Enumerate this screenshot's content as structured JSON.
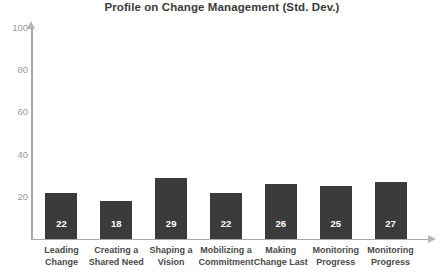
{
  "chart_data": {
    "type": "bar",
    "title": "Profile on Change Management (Std. Dev.)",
    "xlabel": "",
    "ylabel": "",
    "ylim": [
      0,
      100
    ],
    "yticks": [
      100,
      80,
      60,
      40,
      20
    ],
    "grid": false,
    "legend": null,
    "bar_color": "#3b3b3b",
    "axis_color": "#a8a8a8",
    "value_label_color": "#ffffff",
    "categories": [
      "Leading\nChange",
      "Creating a\nShared Need",
      "Shaping a\nVision",
      "Mobilizing a\nCommitment",
      "Making\nChange Last",
      "Monitoring\nProgress",
      "Monitoring\nProgress"
    ],
    "values": [
      22,
      18,
      29,
      22,
      26,
      25,
      27
    ],
    "value_labels": [
      "22",
      "18",
      "29",
      "22",
      "26",
      "25",
      "27"
    ]
  }
}
